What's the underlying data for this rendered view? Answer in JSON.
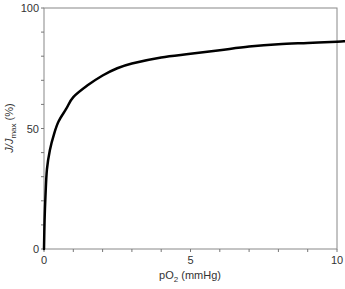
{
  "chart_data": {
    "type": "line",
    "title": "",
    "xlabel": "pO2 (mmHg)",
    "xlabel_parts": {
      "main": "pO",
      "sub": "2",
      "rest": " (mmHg)"
    },
    "ylabel": "J/Jmax (%)",
    "ylabel_parts": {
      "main": "J/J",
      "sub": "max",
      "rest": " (%)"
    },
    "xlim": [
      0,
      10
    ],
    "ylim": [
      0,
      100
    ],
    "x_ticks_labeled": [
      "0",
      "5",
      "10"
    ],
    "y_ticks_labeled": [
      "0",
      "50",
      "100"
    ],
    "x_minor_tick_step": 1,
    "y_minor_tick_step": 10,
    "grid": false,
    "frame": "box",
    "series": [
      {
        "name": "J/Jmax",
        "color": "#000000",
        "x": [
          0,
          0.02,
          0.05,
          0.1,
          0.2,
          0.35,
          0.5,
          0.75,
          1.0,
          1.5,
          2.0,
          2.5,
          3.0,
          4.0,
          5.0,
          6.0,
          7.0,
          8.0,
          9.0,
          10.0,
          10.3
        ],
        "y": [
          0,
          12,
          22,
          33,
          41,
          48,
          53,
          58,
          63,
          68,
          72,
          75,
          77,
          79.5,
          81,
          82.5,
          84,
          85,
          85.5,
          86,
          86.2
        ]
      }
    ]
  }
}
